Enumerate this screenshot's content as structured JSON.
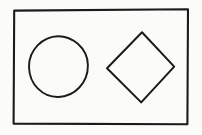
{
  "figure": {
    "title": "Hand-drawn figure: circle and diamond inside a rectangle",
    "medium": "pen-on-paper line drawing",
    "canvas": {
      "width": 202,
      "height": 135,
      "background_color": "#fbfbfa",
      "page_color": "#ffffff"
    },
    "ink_color": "#1b1b1b",
    "shape_count": "3",
    "shapes": [
      {
        "id": "frame",
        "name": "rectangle",
        "label": "Rectangle border",
        "stroke_color": "#1b1b1b",
        "stroke_width": "2.1",
        "fill": "none",
        "bounds": {
          "left": 13,
          "top": 9,
          "right": 188,
          "bottom": 124
        },
        "width": 175,
        "height": 115,
        "path": "M14.2 10.6 L188.0 9.2 L187.4 124.2 L13.6 123.6 Z"
      },
      {
        "id": "circle",
        "name": "circle",
        "label": "Circle",
        "stroke_color": "#1b1b1b",
        "stroke_width": "1.9",
        "fill": "none",
        "center_x": 58.5,
        "center_y": 66.5,
        "radius": 29,
        "bounds": {
          "left": 29,
          "top": 36,
          "right": 88,
          "bottom": 97
        },
        "path": "M58.0 36.2 C72.0 36.0 87.6 47.8 87.9 65.0 C88.2 82.8 74.6 96.6 58.4 97.0 C42.8 97.4 29.3 84.4 29.0 67.0 C28.7 49.6 43.2 36.4 58.0 36.2 Z"
      },
      {
        "id": "diamond",
        "name": "diamond",
        "label": "Diamond (rotated square)",
        "stroke_color": "#1b1b1b",
        "stroke_width": "2.0",
        "fill": "none",
        "bounds": {
          "left": 107,
          "top": 32,
          "right": 174,
          "bottom": 103
        },
        "vertices": [
          {
            "name": "top",
            "x": 142,
            "y": 32
          },
          {
            "name": "right",
            "x": 174,
            "y": 67
          },
          {
            "name": "bottom",
            "x": 141,
            "y": 102
          },
          {
            "name": "left",
            "x": 107,
            "y": 68
          }
        ],
        "path": "M142.0 32.2 L174.2 66.6 L141.2 102.4 L107.0 68.2 Z"
      }
    ]
  }
}
